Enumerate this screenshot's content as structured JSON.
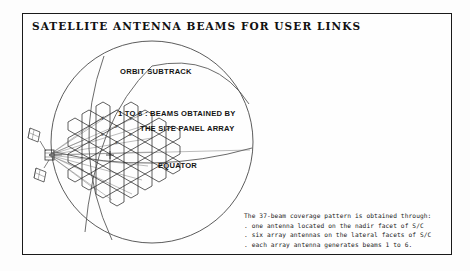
{
  "figure": {
    "title": "SATELLITE ANTENNA BEAMS FOR USER LINKS",
    "border_color": "#1a1a1a",
    "background_color": "#fefefe",
    "ink_color": "#3c3c3c"
  },
  "diagram": {
    "labels": {
      "orbit_subtrack": "ORBIT SUBTRACK",
      "beams_line1": "1 TO 6 : BEAMS OBTAINED BY",
      "beams_line2": "THE SITE PANEL ARRAY",
      "equator": "EQUATOR"
    },
    "globe": {
      "center_x": 152,
      "center_y": 142,
      "radius": 101
    },
    "beam_cell_numbers": [
      "1",
      "2",
      "3",
      "4",
      "5",
      "6"
    ],
    "beam_count": 37
  },
  "caption": {
    "lines": [
      "The 37-beam coverage pattern is obtained through:",
      ". one antenna located on the nadir facet of S/C",
      ". six array antennas on the lateral facets of S/C",
      ". each array antenna generates beams 1 to 6."
    ]
  }
}
